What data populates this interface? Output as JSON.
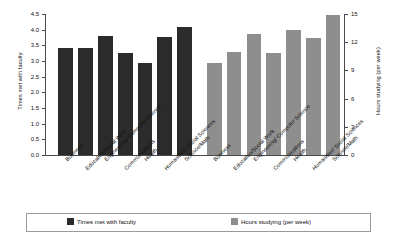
{
  "chart_data": {
    "type": "bar",
    "title": "",
    "xlabel": "",
    "grid": false,
    "legend_position": "bottom",
    "categories": [
      "Business",
      "Education/Social Work",
      "Engineering/\nComputer Science",
      "Communications",
      "Health",
      "Humanities/\nSocial Sciences",
      "Science/Math"
    ],
    "series": [
      {
        "name": "Times met with faculty",
        "axis": "left",
        "color": "#2b2b2b",
        "values": [
          3.4,
          3.42,
          3.8,
          3.25,
          2.95,
          3.77,
          4.07
        ]
      },
      {
        "name": "Hours studying (per week)",
        "axis": "right",
        "color": "#8e8e8e",
        "values": [
          9.8,
          11.0,
          12.9,
          10.9,
          13.3,
          12.5,
          14.9
        ]
      }
    ],
    "left_axis": {
      "label": "Times met with faculty",
      "ylim": [
        0.0,
        4.5
      ],
      "ticks": [
        "0.0",
        "0.5",
        "1.0",
        "1.5",
        "2.0",
        "2.5",
        "3.0",
        "3.5",
        "4.0",
        "4.5"
      ],
      "tick_values": [
        0.0,
        0.5,
        1.0,
        1.5,
        2.0,
        2.5,
        3.0,
        3.5,
        4.0,
        4.5
      ]
    },
    "right_axis": {
      "label": "Hours studying (per week)",
      "ylim": [
        0,
        15
      ],
      "ticks": [
        "0",
        "3",
        "6",
        "9",
        "12",
        "15"
      ],
      "tick_values": [
        0,
        3,
        6,
        9,
        12,
        15
      ]
    }
  },
  "legend": {
    "items": [
      {
        "label": "Times met with faculty",
        "color": "#2b2b2b"
      },
      {
        "label": "Hours studying (per week)",
        "color": "#8e8e8e"
      }
    ]
  },
  "x_labels_left": [
    "Business",
    "Education/Social Work",
    "Engineering/ Computer Science",
    "Communications",
    "Health",
    "Humanities/ Social Sciences",
    "Science/Math"
  ],
  "x_labels_right": [
    "Business",
    "Education/Social Work",
    "Engineering/ Computer Science",
    "Communications",
    "Health",
    "Humanities/ Social Sciences",
    "Science/Math"
  ]
}
